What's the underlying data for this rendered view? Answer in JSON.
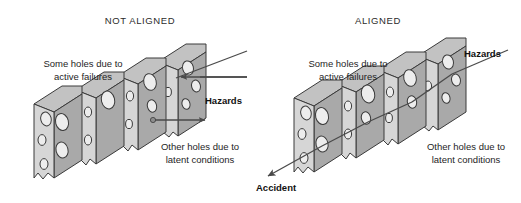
{
  "figure": {
    "background_color": "#ffffff",
    "width": 521,
    "height": 203
  },
  "colors": {
    "cheese_face": "#d6d6d6",
    "cheese_side": "#a9a9a9",
    "cheese_top": "#c2c2c2",
    "hole_fill": "#ededed",
    "outline": "#3a3a3a",
    "arrow": "#4a4a4a",
    "text": "#1e1e1e"
  },
  "panels": [
    {
      "id": "not-aligned",
      "title": "NOT ALIGNED",
      "title_x": 140,
      "annotations": {
        "active_failures": {
          "line1": "Some holes due to",
          "line2": "active failures"
        },
        "latent_conditions": {
          "line1": "Other holes due to",
          "line2": "latent conditions"
        }
      },
      "outcome": {
        "label": "Hazards",
        "direction": "right",
        "blocked": true
      },
      "slice_count": 4
    },
    {
      "id": "aligned",
      "title": "ALIGNED",
      "title_x": 378,
      "annotations": {
        "active_failures": {
          "line1": "Some holes due to",
          "line2": "active failures"
        },
        "latent_conditions": {
          "line1": "Other holes due to",
          "line2": "latent conditions"
        }
      },
      "outcome": {
        "label": "Hazards",
        "direction": "right",
        "blocked": false
      },
      "accident": {
        "label": "Accident",
        "direction": "down-left"
      },
      "slice_count": 4
    }
  ]
}
